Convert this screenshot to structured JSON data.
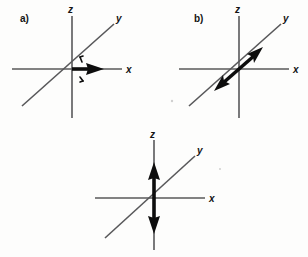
{
  "figure": {
    "type": "vector-coordinate-diagrams",
    "background_color": "#fdfdfc",
    "axis_color": "#58585a",
    "vector_color": "#0d0d0d",
    "panels": [
      {
        "id": "a",
        "label": "a)",
        "axes": [
          {
            "name": "z",
            "label": "z",
            "direction": "vertical"
          },
          {
            "name": "y",
            "label": "y",
            "direction": "diagonal"
          },
          {
            "name": "x",
            "label": "x",
            "direction": "horizontal"
          }
        ],
        "vector": {
          "name": "x-axis-single-arrow",
          "orientation": "horizontal",
          "heads": "single",
          "points_to": "+x",
          "has_tick_marks": true
        }
      },
      {
        "id": "b",
        "label": "b)",
        "axes": [
          {
            "name": "z",
            "label": "z",
            "direction": "vertical"
          },
          {
            "name": "y",
            "label": "y",
            "direction": "diagonal"
          },
          {
            "name": "x",
            "label": "x",
            "direction": "horizontal"
          }
        ],
        "vector": {
          "name": "y-axis-double-arrow",
          "orientation": "diagonal",
          "heads": "double",
          "points_to": "+y and -y",
          "has_tick_marks": false
        }
      },
      {
        "id": "c",
        "label": "",
        "axes": [
          {
            "name": "z",
            "label": "z",
            "direction": "vertical"
          },
          {
            "name": "y",
            "label": "y",
            "direction": "diagonal"
          },
          {
            "name": "x",
            "label": "x",
            "direction": "horizontal"
          }
        ],
        "vector": {
          "name": "z-axis-double-arrow",
          "orientation": "vertical",
          "heads": "double",
          "points_to": "+z and -z",
          "has_tick_marks": false
        }
      }
    ]
  }
}
